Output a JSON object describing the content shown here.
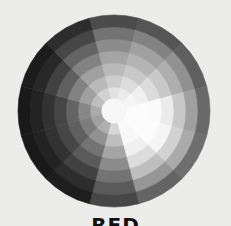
{
  "caption": "RED",
  "wheel": {
    "center": [
      114,
      111
    ],
    "ring_radii": [
      12,
      24,
      36,
      48,
      60,
      72,
      84,
      96
    ],
    "sector_start_deg": -15,
    "sector_count": 12,
    "background": "#ececea",
    "center_fill": "#f6f6f6",
    "gray_levels_by_sector": [
      [
        225,
        205,
        185,
        165,
        140,
        115,
        75
      ],
      [
        235,
        220,
        200,
        180,
        160,
        130,
        85
      ],
      [
        245,
        240,
        220,
        200,
        175,
        145,
        95
      ],
      [
        252,
        252,
        250,
        235,
        200,
        160,
        105
      ],
      [
        252,
        252,
        252,
        245,
        210,
        170,
        110
      ],
      [
        250,
        248,
        240,
        220,
        190,
        150,
        100
      ],
      [
        215,
        190,
        165,
        140,
        115,
        90,
        70
      ],
      [
        175,
        145,
        115,
        90,
        65,
        45,
        30
      ],
      [
        160,
        125,
        95,
        70,
        50,
        35,
        25
      ],
      [
        170,
        135,
        100,
        70,
        50,
        35,
        25
      ],
      [
        190,
        160,
        130,
        95,
        65,
        40,
        28
      ],
      [
        210,
        185,
        160,
        130,
        100,
        70,
        45
      ]
    ]
  }
}
